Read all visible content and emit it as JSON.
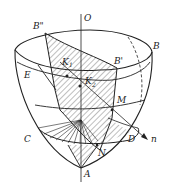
{
  "diagram": {
    "type": "3D geometric figure (paraboloid-like bowl with cutting planes)",
    "labels": {
      "O": "O",
      "B2": "B\"",
      "B": "B",
      "B1": "B'",
      "K1": "K",
      "K1_sub": "1",
      "K2": "K",
      "K2_sub": "2",
      "E": "E",
      "M": "M",
      "C": "C",
      "D": "D",
      "N": "N",
      "n": "n",
      "A": "A"
    },
    "colors": {
      "stroke": "#222222",
      "hatch": "#444444",
      "background": "#ffffff"
    }
  }
}
